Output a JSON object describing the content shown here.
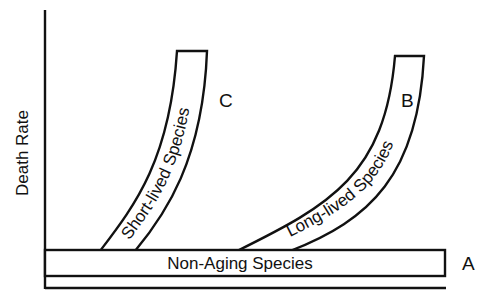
{
  "diagram": {
    "y_axis_label": "Death Rate",
    "curves": [
      {
        "id": "A",
        "letter": "A",
        "label": "Non-Aging Species",
        "shape": "flat"
      },
      {
        "id": "B",
        "letter": "B",
        "label": "Long-lived Species",
        "shape": "late rising"
      },
      {
        "id": "C",
        "letter": "C",
        "label": "Short-lived Species",
        "shape": "early rising"
      }
    ]
  },
  "colors": {
    "ink": "#111111",
    "background": "#ffffff"
  }
}
